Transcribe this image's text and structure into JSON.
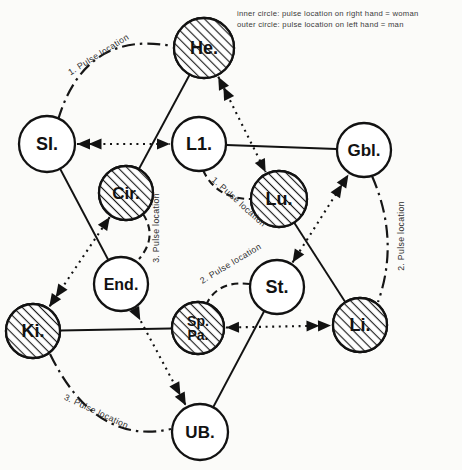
{
  "legend": {
    "line1": "inner circle: pulse location on right hand = woman",
    "line2": "outer circle: pulse location on left hand = man"
  },
  "colors": {
    "ink": "#121212",
    "label_ink": "#2e2e2e",
    "background": "#fbfbf9",
    "circle_fill": "#ffffff"
  },
  "diagram": {
    "nodes": [
      {
        "id": "He",
        "label": "He.",
        "x": 204,
        "y": 48,
        "r": 30,
        "hatched": true,
        "font": 18
      },
      {
        "id": "SI",
        "label": "SI.",
        "x": 47,
        "y": 144,
        "r": 28,
        "hatched": false,
        "font": 18
      },
      {
        "id": "L1",
        "label": "L1.",
        "x": 199,
        "y": 144,
        "r": 27,
        "hatched": false,
        "font": 18
      },
      {
        "id": "Gbl",
        "label": "Gbl.",
        "x": 364,
        "y": 150,
        "r": 27,
        "hatched": false,
        "font": 17
      },
      {
        "id": "Cir",
        "label": "Cir.",
        "x": 126,
        "y": 193,
        "r": 27,
        "hatched": true,
        "font": 17
      },
      {
        "id": "Lu",
        "label": "Lu.",
        "x": 279,
        "y": 199,
        "r": 28,
        "hatched": true,
        "font": 18
      },
      {
        "id": "End",
        "label": "End.",
        "x": 121,
        "y": 284,
        "r": 27,
        "hatched": false,
        "font": 16
      },
      {
        "id": "St",
        "label": "St.",
        "x": 277,
        "y": 287,
        "r": 27,
        "hatched": false,
        "font": 18
      },
      {
        "id": "SpPa",
        "lines": [
          "Sp.",
          "Pa."
        ],
        "x": 198,
        "y": 328,
        "r": 26,
        "hatched": true,
        "font": 14
      },
      {
        "id": "Ki",
        "label": "Ki.",
        "x": 33,
        "y": 331,
        "r": 27,
        "hatched": true,
        "font": 18
      },
      {
        "id": "Li",
        "label": "Li.",
        "x": 360,
        "y": 325,
        "r": 27,
        "hatched": true,
        "font": 18
      },
      {
        "id": "UB",
        "label": "UB.",
        "x": 200,
        "y": 432,
        "r": 28,
        "hatched": false,
        "font": 17
      }
    ],
    "solid_edges": [
      {
        "from": "He",
        "to": "Cir"
      },
      {
        "from": "SI",
        "to": "End"
      },
      {
        "from": "L1",
        "to": "Gbl"
      },
      {
        "from": "Lu",
        "to": "Li"
      },
      {
        "from": "Ki",
        "to": "SpPa"
      },
      {
        "from": "St",
        "to": "UB"
      }
    ],
    "dotted_edges": [
      {
        "from": "SI",
        "to": "L1",
        "arrows_from": 2,
        "arrows_to": 1,
        "from_orient": "in",
        "to_orient": "in"
      },
      {
        "from": "He",
        "to": "Lu",
        "arrows_from": 2,
        "arrows_to": 1,
        "from_orient": "in",
        "to_orient": "in"
      },
      {
        "from": "Cir",
        "to": "Ki",
        "arrows_from": 1,
        "arrows_to": 2,
        "from_orient": "in",
        "to_orient": "in"
      },
      {
        "from": "End",
        "to": "UB",
        "arrows_from": 1,
        "arrows_to": 2,
        "from_orient": "out",
        "to_orient": "in"
      },
      {
        "from": "St",
        "to": "Gbl",
        "arrows_from": 1,
        "arrows_to": 2,
        "from_orient": "in",
        "to_orient": "in"
      },
      {
        "from": "SpPa",
        "to": "Li",
        "arrows_from": 1,
        "arrows_to": 2,
        "from_orient": "in",
        "to_orient": "in"
      }
    ],
    "arcs": [
      {
        "from": "SI",
        "to": "He",
        "style": "dashdot",
        "s": [
          58,
          120
        ],
        "c": [
          85,
          30
        ],
        "e": [
          172,
          46
        ]
      },
      {
        "from": "L1",
        "to": "Lu",
        "style": "dashed",
        "s": [
          203,
          170
        ],
        "c": [
          216,
          199
        ],
        "e": [
          251,
          199
        ]
      },
      {
        "from": "Cir",
        "to": "End",
        "style": "dashed",
        "s": [
          143,
          214
        ],
        "c": [
          158,
          237
        ],
        "e": [
          139,
          259
        ]
      },
      {
        "from": "St",
        "to": "SpPa",
        "style": "dashed",
        "s": [
          250,
          284
        ],
        "c": [
          219,
          280
        ],
        "e": [
          207,
          303
        ]
      },
      {
        "from": "Gbl",
        "to": "Li",
        "style": "dashdot",
        "s": [
          372,
          176
        ],
        "c": [
          400,
          240
        ],
        "e": [
          378,
          302
        ]
      },
      {
        "from": "Ki",
        "to": "UB",
        "style": "dashdot",
        "s": [
          50,
          354
        ],
        "c": [
          95,
          446
        ],
        "e": [
          171,
          429
        ]
      }
    ],
    "labels": [
      {
        "text": "1. Pulse location",
        "x": 100,
        "y": 57,
        "rot": -32
      },
      {
        "text": "1. Pulse location",
        "x": 237,
        "y": 204,
        "rot": 42
      },
      {
        "text": "3. Pulse location",
        "x": 159,
        "y": 228,
        "rot": -90
      },
      {
        "text": "2. Pulse location",
        "x": 232,
        "y": 266,
        "rot": -31
      },
      {
        "text": "2. Pulse location",
        "x": 404,
        "y": 236,
        "rot": -90
      },
      {
        "text": "3. Pulse location",
        "x": 95,
        "y": 414,
        "rot": 25
      }
    ]
  }
}
